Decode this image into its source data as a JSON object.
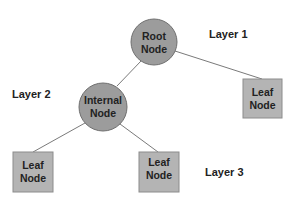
{
  "diagram": {
    "type": "tree",
    "colors": {
      "circle_fill": "#9c9c9c",
      "circle_stroke": "#6f6f6f",
      "leaf_fill": "#b4b4b4",
      "leaf_stroke": "#8c8c8c",
      "edge": "#7a7a7a",
      "text": "#222222"
    },
    "layers": [
      {
        "label": "Layer 1"
      },
      {
        "label": "Layer 2"
      },
      {
        "label": "Layer 3"
      }
    ],
    "nodes": {
      "root": {
        "line1": "Root",
        "line2": "Node",
        "shape": "circle"
      },
      "internal": {
        "line1": "Internal",
        "line2": "Node",
        "shape": "circle"
      },
      "leaf_right": {
        "line1": "Leaf",
        "line2": "Node",
        "shape": "square"
      },
      "leaf_bottom_left": {
        "line1": "Leaf",
        "line2": "Node",
        "shape": "square"
      },
      "leaf_bottom_middle": {
        "line1": "Leaf",
        "line2": "Node",
        "shape": "square"
      }
    },
    "edges": [
      {
        "from": "root",
        "to": "internal"
      },
      {
        "from": "root",
        "to": "leaf_right"
      },
      {
        "from": "internal",
        "to": "leaf_bottom_left"
      },
      {
        "from": "internal",
        "to": "leaf_bottom_middle"
      }
    ]
  }
}
